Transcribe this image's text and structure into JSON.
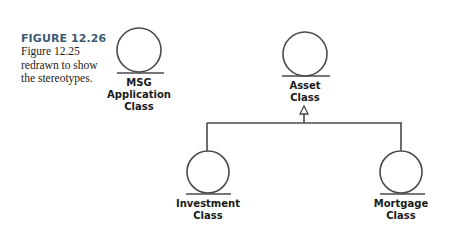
{
  "caption": {
    "figure_label": "FIGURE 12.26",
    "text_lines": [
      "Figure 12.25",
      "redrawn to show",
      "the stereotypes."
    ]
  },
  "classes": [
    {
      "id": "msg",
      "lines": [
        "MSG",
        "Application",
        "Class"
      ],
      "cx": 139,
      "cy": 48,
      "r": 22,
      "base_y": 73
    },
    {
      "id": "asset",
      "lines": [
        "Asset",
        "Class"
      ],
      "cx": 305,
      "cy": 53,
      "r": 22,
      "base_y": 76
    },
    {
      "id": "investment",
      "lines": [
        "Investment",
        "Class"
      ],
      "cx": 208,
      "cy": 171,
      "r": 21,
      "base_y": 194
    },
    {
      "id": "mortgage",
      "lines": [
        "Mortgage",
        "Class"
      ],
      "cx": 401,
      "cy": 171,
      "r": 21,
      "base_y": 194
    }
  ],
  "relationships": [
    {
      "type": "generalization",
      "parent": "Asset Class",
      "children": [
        "Investment Class",
        "Mortgage Class"
      ]
    }
  ],
  "colors": {
    "stroke": "#4a4a4a",
    "caption_title": "#3c5a72"
  }
}
